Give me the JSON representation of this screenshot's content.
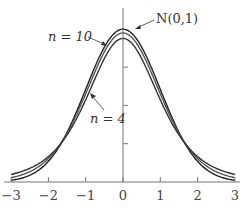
{
  "chart_data": {
    "type": "line",
    "title": "",
    "xlabel": "",
    "ylabel": "",
    "xlim": [
      -3,
      3
    ],
    "ylim": [
      0,
      0.4
    ],
    "x_ticks": [
      "−3",
      "−2",
      "−1",
      "0",
      "1",
      "2",
      "3"
    ],
    "y_ticks": [
      0.1,
      0.2,
      0.3
    ],
    "grid": false,
    "series": [
      {
        "name": "N(0,1)",
        "distribution": "normal",
        "peak": 0.399,
        "color": "#222222"
      },
      {
        "name": "n = 10",
        "distribution": "t",
        "df": 10,
        "peak": 0.389,
        "color": "#555555"
      },
      {
        "name": "n = 4",
        "distribution": "t",
        "df": 4,
        "peak": 0.375,
        "color": "#333333"
      }
    ],
    "annotations": [
      {
        "text": "N(0,1)",
        "points_to": "normal curve near peak, right side"
      },
      {
        "text": "n = 10",
        "points_to": "t(10) curve, upper left side"
      },
      {
        "text": "n = 4",
        "points_to": "t(4) curve, left side"
      }
    ]
  },
  "labels": {
    "normal": "N(0,1)",
    "n10": "n = 10",
    "n4": "n = 4"
  },
  "ticks": {
    "x": [
      "−3",
      "−2",
      "−1",
      "0",
      "1",
      "2",
      "3"
    ]
  }
}
